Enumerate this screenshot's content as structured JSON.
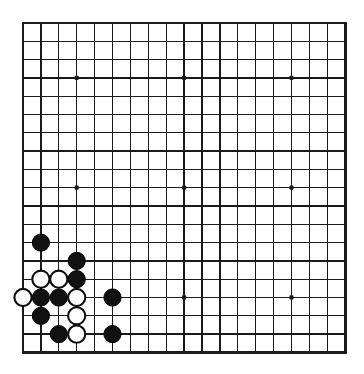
{
  "board": {
    "title": "Go board position",
    "game": "go",
    "size": 19,
    "colors": {
      "background": "#ffffff",
      "line": "#1a1a1a",
      "black_stone": "#111111",
      "white_stone": "#ffffff",
      "white_stone_outline": "#0d0d0d"
    },
    "geometry": {
      "origin_x": 23,
      "origin_y": 23,
      "step_x": 17.9,
      "step_y": 18.3,
      "stone_radius": 8.6
    },
    "star_points": [
      {
        "col": 3,
        "row": 3
      },
      {
        "col": 9,
        "row": 3
      },
      {
        "col": 15,
        "row": 3
      },
      {
        "col": 3,
        "row": 9
      },
      {
        "col": 9,
        "row": 9
      },
      {
        "col": 15,
        "row": 9
      },
      {
        "col": 3,
        "row": 15
      },
      {
        "col": 9,
        "row": 15
      },
      {
        "col": 15,
        "row": 15
      }
    ],
    "stones": [
      {
        "color": "black",
        "col": 1,
        "row": 12,
        "label": "black-stone-b7"
      },
      {
        "color": "black",
        "col": 3,
        "row": 13,
        "label": "black-stone-d6"
      },
      {
        "color": "white",
        "col": 1,
        "row": 14,
        "label": "white-stone-b5"
      },
      {
        "color": "white",
        "col": 2,
        "row": 14,
        "label": "white-stone-c5"
      },
      {
        "color": "black",
        "col": 3,
        "row": 14,
        "label": "black-stone-d5"
      },
      {
        "color": "white",
        "col": 0,
        "row": 15,
        "label": "white-stone-a4"
      },
      {
        "color": "black",
        "col": 1,
        "row": 15,
        "label": "black-stone-b4"
      },
      {
        "color": "black",
        "col": 2,
        "row": 15,
        "label": "black-stone-c4"
      },
      {
        "color": "white",
        "col": 3,
        "row": 15,
        "label": "white-stone-d4"
      },
      {
        "color": "black",
        "col": 5,
        "row": 15,
        "label": "black-stone-f4"
      },
      {
        "color": "black",
        "col": 1,
        "row": 16,
        "label": "black-stone-b3"
      },
      {
        "color": "white",
        "col": 3,
        "row": 16,
        "label": "white-stone-d3"
      },
      {
        "color": "black",
        "col": 2,
        "row": 17,
        "label": "black-stone-c2"
      },
      {
        "color": "white",
        "col": 3,
        "row": 17,
        "label": "white-stone-d2"
      },
      {
        "color": "black",
        "col": 5,
        "row": 17,
        "label": "black-stone-f2"
      }
    ],
    "counts": {
      "black": 9,
      "white": 6,
      "total": 15
    }
  }
}
